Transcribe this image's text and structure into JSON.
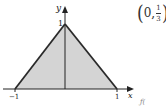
{
  "figure": {
    "type": "region-plot",
    "region": {
      "shape": "triangle",
      "vertices": [
        [
          -1,
          0
        ],
        [
          0,
          1
        ],
        [
          1,
          0
        ]
      ],
      "fill": "#d4d4d4",
      "stroke": "#2a2a2a"
    },
    "axes": {
      "x_label": "x",
      "y_label": "y",
      "x_ticks": [
        "−1",
        "1"
      ],
      "y_ticks": [
        "1"
      ],
      "color": "#222222"
    },
    "annotation": {
      "open": "(",
      "x": "0,",
      "numerator": "1",
      "denominator": "3",
      "close": ")"
    },
    "stray_text": "ƒ("
  }
}
